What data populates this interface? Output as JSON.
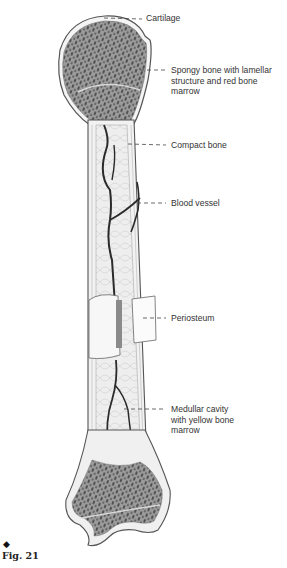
{
  "figure": {
    "marker": "◆",
    "caption": "Fig. 21"
  },
  "labels": [
    {
      "id": "cartilage",
      "text": "Cartilage"
    },
    {
      "id": "spongy-bone",
      "text": "Spongy bone with lamellar\nstructure and red bone\nmarrow"
    },
    {
      "id": "compact-bone",
      "text": "Compact bone"
    },
    {
      "id": "blood-vessel",
      "text": "Blood vessel"
    },
    {
      "id": "periosteum",
      "text": "Periosteum"
    },
    {
      "id": "medullar-cavity",
      "text": "Medullar cavity\nwith yellow bone\nmarrow"
    }
  ],
  "colors": {
    "outline": "#555555",
    "spongy": "#9a9a9a",
    "spongy_dots": "#3a3a3a",
    "shaft": "#ececec",
    "vessel": "#2a2a2a",
    "leader": "#444444"
  }
}
